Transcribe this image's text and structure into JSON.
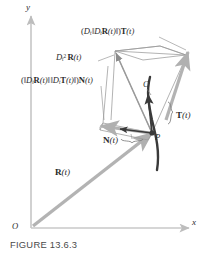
{
  "figure": {
    "caption": "FIGURE 13.6.3",
    "axes": {
      "x_label": "x",
      "y_label": "y",
      "origin_label": "O"
    },
    "labels": {
      "tangential_component": "(D_t ||D_t R(t)||) T(t)",
      "acceleration": "D_t² R(t)",
      "normal_component": "(||D_t R(t)|| ||D_t T(t)||) N(t)",
      "curve": "C",
      "tangent_vector": "T(t)",
      "point": "P",
      "normal_vector": "N(t)",
      "position_vector": "R(t)"
    },
    "colors": {
      "axis": "#c9c9c9",
      "vector_gray": "#b3b3b3",
      "curve_dark": "#3a3a3a",
      "thin_line": "#8c8c8c",
      "text": "#2b2b2b",
      "caption_text": "#4a4a4a",
      "background": "#ffffff"
    }
  }
}
